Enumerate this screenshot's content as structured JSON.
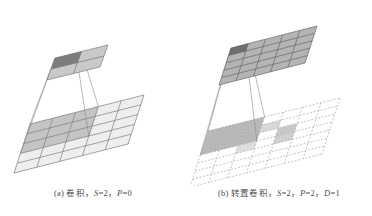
{
  "figure": {
    "title": "",
    "background_color": "#ffffff",
    "width": 372,
    "height": 216
  },
  "panels": [
    {
      "id": "panel-a",
      "label": "(a)",
      "caption_full": "(a) 卷积，S=2，P=0",
      "caption_prefix": "(a) 卷积，",
      "caption_terms": [
        {
          "symbol": "S",
          "value": "=2",
          "sep": "，"
        },
        {
          "symbol": "P",
          "value": "=0",
          "sep": ""
        }
      ],
      "operation_name": "卷积",
      "params": {
        "S": 2,
        "P": 0
      },
      "output_grid": {
        "name": "output-feature-map",
        "rows": 2,
        "cols": 2,
        "fill": "#c9c9c9",
        "stroke": "#6b6b6b",
        "highlight_cells": [
          {
            "row": 0,
            "col": 0,
            "fill": "#7d7d7d"
          }
        ]
      },
      "input_grid": {
        "name": "input-feature-map",
        "rows": 5,
        "cols": 5,
        "fill": "#eeeeee",
        "stroke": "#6b6b6b",
        "highlight_region": {
          "row": 0,
          "col": 0,
          "rows": 3,
          "cols": 3,
          "fill": "#c4c4c4"
        },
        "dashed": false
      },
      "projection": {
        "name": "receptive-field-projection",
        "stroke": "#8a8a8a",
        "from_cell": {
          "row": 0,
          "col": 0
        },
        "to_region": {
          "row": 0,
          "col": 0,
          "rows": 3,
          "cols": 3
        }
      }
    },
    {
      "id": "panel-b",
      "label": "(b)",
      "caption_full": "(b) 转置卷积，S=2，P=2，D=1",
      "caption_prefix": "(b) 转置卷积，",
      "caption_terms": [
        {
          "symbol": "S",
          "value": "=2",
          "sep": "，"
        },
        {
          "symbol": "P",
          "value": "=2",
          "sep": "，"
        },
        {
          "symbol": "D",
          "value": "=1",
          "sep": ""
        }
      ],
      "operation_name": "转置卷积",
      "params": {
        "S": 2,
        "P": 2,
        "D": 1
      },
      "output_grid": {
        "name": "output-feature-map",
        "rows": 5,
        "cols": 5,
        "fill": "#b4b4b4",
        "stroke": "#5a5a5a",
        "highlight_cells": [
          {
            "row": 0,
            "col": 0,
            "fill": "#6e6e6e"
          }
        ]
      },
      "input_grid": {
        "name": "dilated-padded-input-map",
        "rows": 7,
        "cols": 7,
        "fill": "#ffffff",
        "stroke": "#9a9a9a",
        "dashed": true,
        "highlight_region": {
          "row": 0,
          "col": 0,
          "rows": 3,
          "cols": 3,
          "fill": "#b8b8b8"
        },
        "scatter_cells": [
          {
            "row": 1,
            "col": 3,
            "fill": "#d8d8d8"
          },
          {
            "row": 2,
            "col": 4,
            "fill": "#c8c8c8"
          },
          {
            "row": 3,
            "col": 2,
            "fill": "#dedede"
          },
          {
            "row": 3,
            "col": 4,
            "fill": "#cfcfcf"
          }
        ]
      },
      "projection": {
        "name": "receptive-field-projection",
        "stroke": "#8a8a8a",
        "from_cell": {
          "row": 0,
          "col": 0
        },
        "to_region": {
          "row": 0,
          "col": 0,
          "rows": 3,
          "cols": 3
        }
      }
    }
  ]
}
